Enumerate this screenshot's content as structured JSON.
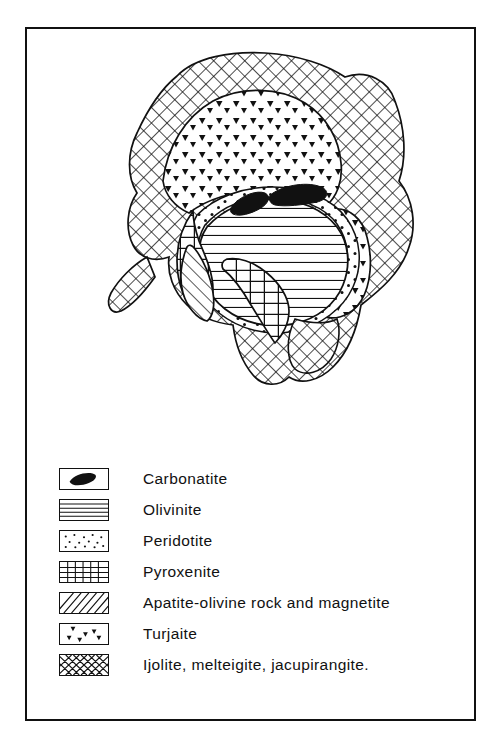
{
  "figure": {
    "type": "geological-map",
    "border_color": "#111111",
    "background_color": "#ffffff"
  },
  "map": {
    "name": "intrusive-complex-map",
    "units": [
      {
        "id": "ijolite",
        "label": "Ijolite, melteigite, jacupirangite.",
        "pattern": "cross-hatch",
        "role": "outermost-ring"
      },
      {
        "id": "turjaite",
        "label": "Turjaite",
        "pattern": "v-marks",
        "role": "inner-ring-north-and-east"
      },
      {
        "id": "peridotite",
        "label": "Peridotite",
        "pattern": "stipple-dots",
        "role": "thin-rim"
      },
      {
        "id": "pyroxenite",
        "label": "Pyroxenite",
        "pattern": "grid",
        "role": "west-and-south-band"
      },
      {
        "id": "apatite",
        "label": "Apatite-olivine rock and magnetite",
        "pattern": "diagonal-hatch",
        "role": "west-lens"
      },
      {
        "id": "olivinite",
        "label": "Olivinite",
        "pattern": "horizontal-lines",
        "role": "core"
      },
      {
        "id": "carbonatite",
        "label": "Carbonatite",
        "pattern": "solid-black",
        "role": "two-small-bodies-in-core"
      }
    ],
    "carbonatite_body_count": 2
  },
  "legend": {
    "name": "map-legend",
    "entries": [
      {
        "key": "carbonatite",
        "label": "Carbonatite",
        "pattern": "solid-black"
      },
      {
        "key": "olivinite",
        "label": "Olivinite",
        "pattern": "horizontal-lines"
      },
      {
        "key": "peridotite",
        "label": "Peridotite",
        "pattern": "stipple-dots"
      },
      {
        "key": "pyroxenite",
        "label": "Pyroxenite",
        "pattern": "grid"
      },
      {
        "key": "apatite",
        "label": "Apatite-olivine rock and magnetite",
        "pattern": "diagonal-hatch"
      },
      {
        "key": "turjaite",
        "label": "Turjaite",
        "pattern": "v-marks"
      },
      {
        "key": "ijolite",
        "label": "Ijolite, melteigite, jacupirangite.",
        "pattern": "cross-hatch"
      }
    ]
  }
}
